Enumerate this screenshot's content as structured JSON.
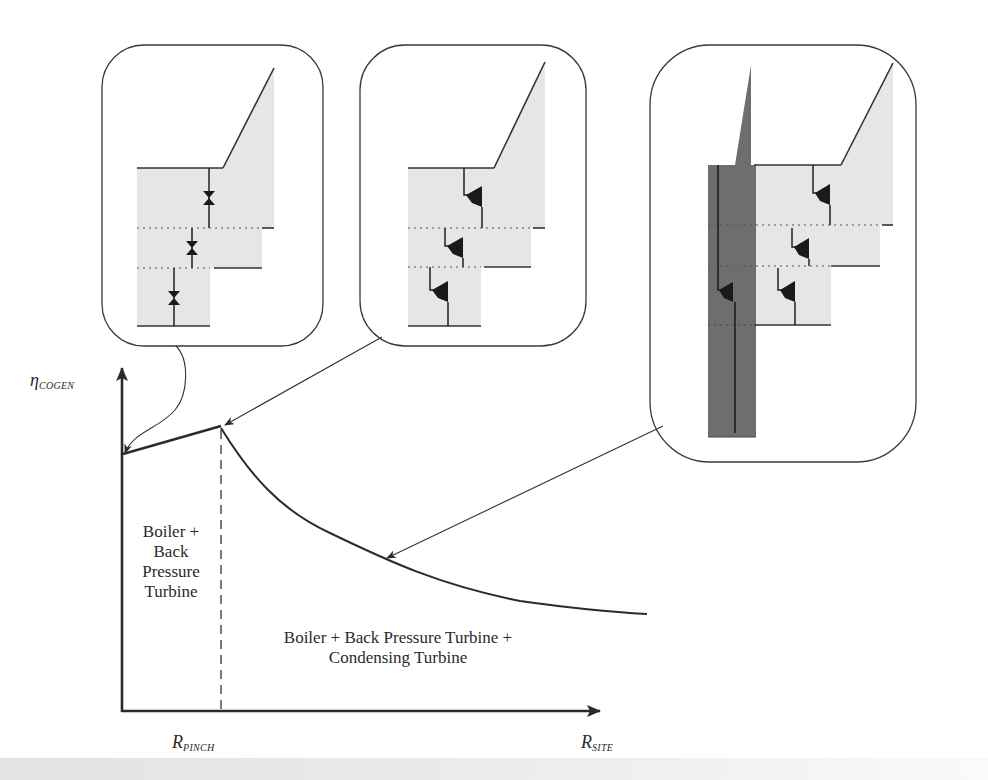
{
  "diagram": {
    "type": "cogeneration efficiency vs site ratio",
    "axes": {
      "y_label_main": "η",
      "y_label_sub": "COGEN",
      "x_tick_pinch_main": "R",
      "x_tick_pinch_sub": "PINCH",
      "x_label_main": "R",
      "x_label_sub": "SITE"
    },
    "regions": {
      "left_lines": [
        "Boiler +",
        "Back",
        "Pressure",
        "Turbine"
      ],
      "right_line1": "Boiler + Back Pressure Turbine +",
      "right_line2": "Condensing Turbine"
    },
    "callouts": [
      {
        "id": "valves",
        "description": "Site profile with let-down valves between steam mains"
      },
      {
        "id": "back-pressure",
        "description": "Site profile with back pressure turbines between steam mains"
      },
      {
        "id": "condensing",
        "description": "Site profile with back pressure turbines plus condensing turbine"
      }
    ],
    "colors": {
      "line": "#2b2b2b",
      "profile_fill": "#e6e6e6",
      "condensing_fill": "#6e6e6e",
      "turbine_glyph": "#1a1a1a"
    }
  }
}
